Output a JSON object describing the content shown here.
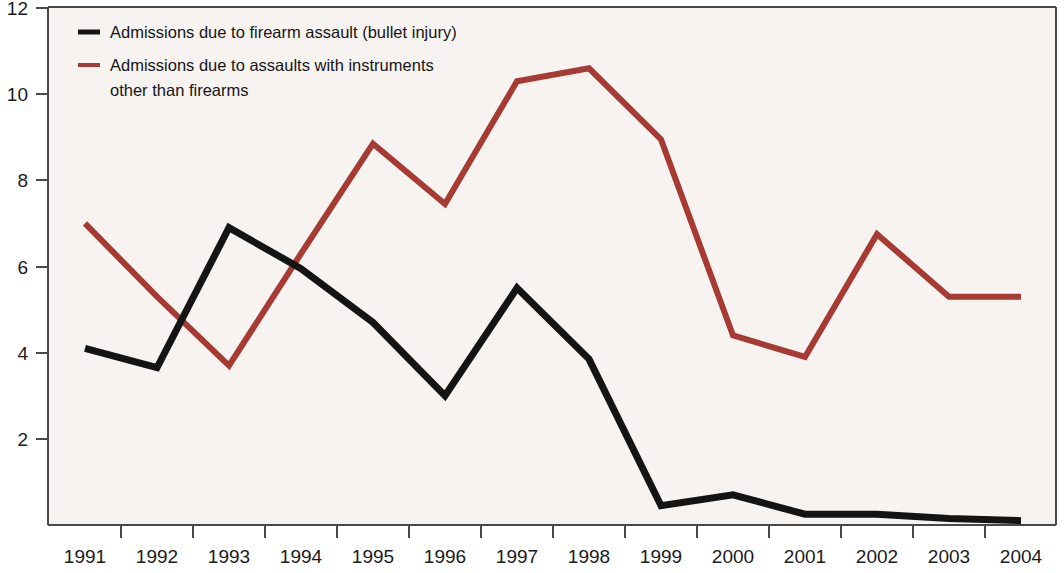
{
  "chart_data": {
    "type": "line",
    "title": "",
    "subtitle": "",
    "xlabel": "",
    "ylabel": "",
    "categories": [
      "1991",
      "1992",
      "1993",
      "1994",
      "1995",
      "1996",
      "1997",
      "1998",
      "1999",
      "2000",
      "2001",
      "2002",
      "2003",
      "2004"
    ],
    "x": [
      1991,
      1992,
      1993,
      1994,
      1995,
      1996,
      1997,
      1998,
      1999,
      2000,
      2001,
      2002,
      2003,
      2004
    ],
    "series": [
      {
        "name": "Admissions due to firearm assault (bullet injury)",
        "color": "#141414",
        "values": [
          4.1,
          3.65,
          6.9,
          5.95,
          4.7,
          3.0,
          5.5,
          3.85,
          0.45,
          0.7,
          0.25,
          0.25,
          0.15,
          0.1
        ]
      },
      {
        "name": "Admissions due to assaults with instruments other than firearms",
        "color": "#a73a33",
        "values": [
          7.0,
          5.3,
          3.7,
          6.3,
          8.85,
          7.45,
          10.3,
          10.6,
          8.95,
          4.4,
          3.9,
          6.75,
          5.3,
          5.3
        ]
      }
    ],
    "ylim": [
      0,
      12
    ],
    "yticks": [
      2,
      4,
      6,
      8,
      10,
      12
    ],
    "ytick_labels": [
      "2",
      "4",
      "6",
      "8",
      "10",
      "12"
    ],
    "xlim": [
      1991,
      2004
    ],
    "grid": false,
    "legend_position": "top-left"
  },
  "legend": {
    "entries": [
      {
        "label": "Admissions due to firearm assault (bullet injury)",
        "color": "#141414"
      },
      {
        "label": "Admissions due to assaults with instruments",
        "label_line2": "other than firearms",
        "color": "#a73a33"
      }
    ]
  },
  "colors": {
    "firearm_series": "#141414",
    "other_instruments_series": "#a73a33",
    "plot_background": "#f7f3f1",
    "axis": "#4a4a4a"
  }
}
